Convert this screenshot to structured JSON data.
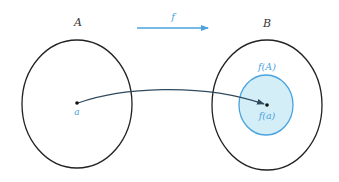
{
  "diagram": {
    "colors": {
      "set_outline": "#222222",
      "accent": "#4aa3df",
      "image_fill": "#d3eef7",
      "curve": "#2f4a5e",
      "point": "#111111"
    },
    "labels": {
      "set_a": "A",
      "set_b": "B",
      "function": "f",
      "element": "a",
      "image_set": "f(A)",
      "image_element": "f(a)"
    }
  }
}
